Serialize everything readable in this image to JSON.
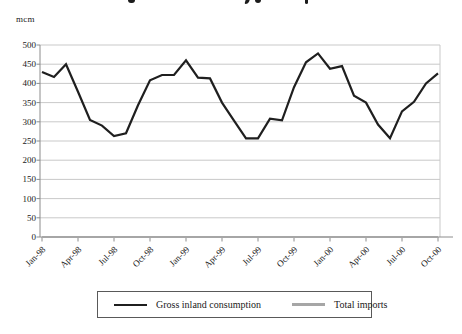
{
  "unit_label": "mcm",
  "legend": {
    "items": [
      {
        "label": "Gross inland consumption",
        "color": "#1f1f1f"
      },
      {
        "label": "Total imports",
        "color": "#a6a6a6"
      }
    ]
  },
  "chart_data": {
    "type": "line",
    "ylabel": "mcm",
    "ylim": [
      0,
      500
    ],
    "ytick_step": 50,
    "ytick_labels": [
      "0",
      "50",
      "100",
      "150",
      "200",
      "250",
      "300",
      "350",
      "400",
      "450",
      "500"
    ],
    "grid": true,
    "legend_position": "bottom",
    "x": [
      "Jan-98",
      "Feb-98",
      "Mar-98",
      "Apr-98",
      "May-98",
      "Jun-98",
      "Jul-98",
      "Aug-98",
      "Sep-98",
      "Oct-98",
      "Nov-98",
      "Dec-98",
      "Jan-99",
      "Feb-99",
      "Mar-99",
      "Apr-99",
      "May-99",
      "Jun-99",
      "Jul-99",
      "Aug-99",
      "Sep-99",
      "Oct-99",
      "Nov-99",
      "Dec-99",
      "Jan-00",
      "Feb-00",
      "Mar-00",
      "Apr-00",
      "May-00",
      "Jun-00",
      "Jul-00",
      "Aug-00",
      "Sep-00",
      "Oct-00"
    ],
    "xtick_labels": [
      "Jan-98",
      "Apr-98",
      "Jul-98",
      "Oct-98",
      "Jan-99",
      "Apr-99",
      "Jul-99",
      "Oct-99",
      "Jan-00",
      "Apr-00",
      "Jul-00",
      "Oct-00"
    ],
    "xtick_every": 3,
    "series": [
      {
        "name": "Gross inland consumption",
        "color": "#1f1f1f",
        "values": [
          430,
          417,
          450,
          378,
          305,
          290,
          263,
          270,
          343,
          408,
          422,
          422,
          460,
          415,
          413,
          350,
          303,
          257,
          257,
          308,
          304,
          390,
          455,
          478,
          438,
          445,
          368,
          350,
          293,
          257,
          327,
          352,
          400,
          426
        ]
      },
      {
        "name": "Total imports",
        "color": "#a6a6a6",
        "values": [
          0,
          0,
          0,
          0,
          0,
          0,
          0,
          0,
          0,
          0,
          0,
          0,
          0,
          0,
          0,
          0,
          0,
          0,
          0,
          0,
          0,
          0,
          0,
          0,
          0,
          0,
          0,
          0,
          0,
          0,
          0,
          0,
          0,
          0
        ]
      }
    ]
  }
}
